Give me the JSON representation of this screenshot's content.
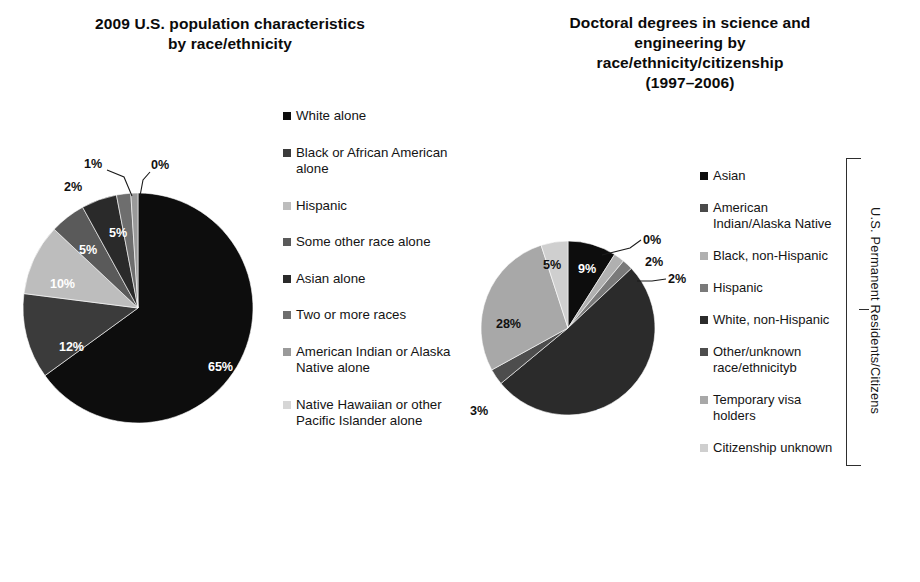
{
  "figure": {
    "bottom_caption": "",
    "bracket_label": "U.S. Permanent Residents/Citizens"
  },
  "left": {
    "title_line1": "2009 U.S. population characteristics",
    "title_line2": "by race/ethnicity"
  },
  "right": {
    "title_line1": "Doctoral degrees in science and",
    "title_line2": "engineering by",
    "title_line3": "race/ethnicity/citizenship",
    "title_line4": "(1997–2006)"
  },
  "chart_data": [
    {
      "type": "pie",
      "id": "us-population-by-race",
      "title": "2009 U.S. population characteristics by race/ethnicity",
      "legend_position": "right",
      "labels": [
        "White alone",
        "Black or African American alone",
        "Hispanic",
        "Some other race alone",
        "Asian alone",
        "Two or more races",
        "American Indian or Alaska Native alone",
        "Native Hawaiian or other Pacific Islander alone"
      ],
      "values": [
        65,
        12,
        10,
        5,
        5,
        2,
        1,
        0
      ],
      "value_labels": [
        "65%",
        "12%",
        "10%",
        "5%",
        "5%",
        "2%",
        "1%",
        "0%"
      ],
      "colors": [
        "#0d0d0d",
        "#3b3b3b",
        "#bdbdbd",
        "#5a5a5a",
        "#2a2a2a",
        "#6e6e6e",
        "#9a9a9a",
        "#d6d6d6"
      ]
    },
    {
      "type": "pie",
      "id": "doctoral-degrees-by-race-citizenship",
      "title": "Doctoral degrees in science and engineering by race/ethnicity/citizenship (1997–2006)",
      "legend_position": "right",
      "labels": [
        "Asian",
        "American Indian/Alaska Native",
        "Black, non-Hispanic",
        "Hispanic",
        "White, non-Hispanic",
        "Other/unknown race/ethnicityb",
        "Temporary visa holders",
        "Citizenship unknown"
      ],
      "values": [
        9,
        0,
        2,
        2,
        51,
        3,
        28,
        5
      ],
      "value_labels": [
        "9%",
        "0%",
        "2%",
        "2%",
        "51%",
        "3%",
        "28%",
        "5%"
      ],
      "colors": [
        "#0d0d0d",
        "#d8d8d8",
        "#b0b0b0",
        "#7a7a7a",
        "#2b2b2b",
        "#4d4d4d",
        "#a8a8a8",
        "#cfcfcf"
      ]
    }
  ]
}
